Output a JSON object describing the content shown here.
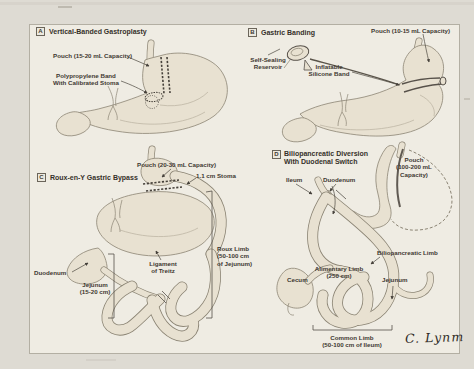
{
  "colors": {
    "paper": "#dedbd3",
    "figure_background": "#efece3",
    "organ_fill": "#e8e1d1",
    "sketch_line": "#8b8474",
    "ink_text": "#3e3831"
  },
  "signature": "C. Lynm",
  "panels": {
    "a": {
      "tag": "A",
      "title": "Vertical-Banded Gastroplasty",
      "labels": {
        "pouch": "Pouch (15-20 mL Capacity)",
        "band": "Polypropylene Band\nWith Calibrated Stoma"
      }
    },
    "b": {
      "tag": "B",
      "title": "Gastric Banding",
      "labels": {
        "pouch": "Pouch (10-15 mL Capacity)",
        "reservoir": "Self-Sealing\nReservoir",
        "band": "Inflatable\nSilicone Band"
      }
    },
    "c": {
      "tag": "C",
      "title": "Roux-en-Y Gastric Bypass",
      "labels": {
        "pouch": "Pouch (20-30 mL Capacity)",
        "stoma": "1.1 cm Stoma",
        "duodenum": "Duodenum",
        "jejunum": "Jejunum\n(15-20 cm)",
        "ligament_of_treitz": "Ligament\nof Treitz",
        "roux_limb": "Roux Limb\n(50-100 cm\nof Jejunum)"
      }
    },
    "d": {
      "tag": "D",
      "title": "Biliopancreatic Diversion\nWith Duodenal Switch",
      "labels": {
        "ileum": "Ileum",
        "duodenum": "Duodenum",
        "pouch": "Pouch\n(100-200 mL\nCapacity)",
        "biliopancreatic_limb": "Biliopancreatic Limb",
        "alimentary_limb": "Alimentary Limb\n(250 cm)",
        "cecum": "Cecum",
        "jejunum": "Jejunum",
        "common_limb": "Common Limb\n(50-100 cm of Ileum)"
      }
    }
  }
}
